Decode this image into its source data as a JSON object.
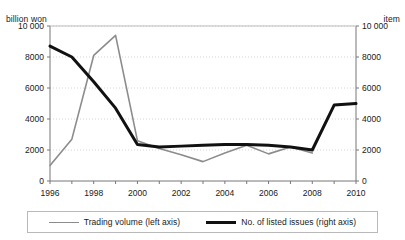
{
  "chart_data": {
    "type": "line",
    "title": "",
    "xlabel": "",
    "ylabel": "billion won",
    "y2label": "item",
    "x": [
      1996,
      1997,
      1998,
      1999,
      2000,
      2001,
      2002,
      2003,
      2004,
      2005,
      2006,
      2007,
      2008,
      2009,
      2010
    ],
    "xlim": [
      1996,
      2010
    ],
    "ylim": [
      0,
      10000
    ],
    "y2lim": [
      0,
      10000
    ],
    "grid": true,
    "legend_position": "bottom",
    "x_tick_labels": [
      "1996",
      "1998",
      "2000",
      "2002",
      "2004",
      "2006",
      "2008",
      "2010"
    ],
    "x_tick_values": [
      1996,
      1998,
      2000,
      2002,
      2004,
      2006,
      2008,
      2010
    ],
    "y_tick_labels": [
      "0",
      "2000",
      "4000",
      "6000",
      "8000",
      "10 000"
    ],
    "y_tick_values": [
      0,
      2000,
      4000,
      6000,
      8000,
      10000
    ],
    "y2_tick_labels": [
      "0",
      "2000",
      "4000",
      "6000",
      "8000",
      "10 000"
    ],
    "y2_tick_values": [
      0,
      2000,
      4000,
      6000,
      8000,
      10000
    ],
    "series": [
      {
        "name": "Trading volume (left axis)",
        "axis": "left",
        "color": "#8c8c8c",
        "width": 1.6,
        "x": [
          1996,
          1997,
          1998,
          1999,
          2000,
          2001,
          2002,
          2003,
          2004,
          2005,
          2006,
          2007,
          2008
        ],
        "values": [
          1000,
          2700,
          8100,
          9400,
          2600,
          2100,
          1700,
          1250,
          1800,
          2300,
          1750,
          2200,
          1800
        ]
      },
      {
        "name": "No. of listed issues (right axis)",
        "axis": "right",
        "color": "#111111",
        "width": 3.0,
        "x": [
          1996,
          1997,
          1998,
          1999,
          2000,
          2001,
          2002,
          2003,
          2004,
          2005,
          2006,
          2007,
          2008,
          2009,
          2010
        ],
        "values": [
          8700,
          8000,
          6400,
          4700,
          2350,
          2200,
          2250,
          2300,
          2350,
          2350,
          2300,
          2200,
          2000,
          4900,
          5000
        ]
      }
    ]
  },
  "axes": {
    "left_unit": "billion won",
    "right_unit": "item"
  },
  "legend": {
    "entries": [
      {
        "label": "Trading volume (left axis)"
      },
      {
        "label": "No. of listed issues (right axis)"
      }
    ]
  }
}
